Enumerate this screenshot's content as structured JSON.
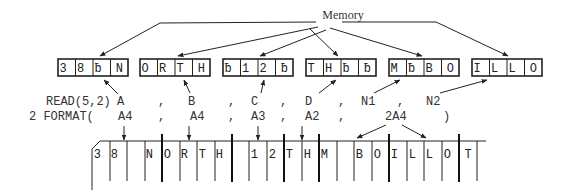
{
  "memory_label": "Memory",
  "memory_words": [
    {
      "var": "A",
      "chars": [
        "3",
        "8",
        "ƀ",
        "N"
      ]
    },
    {
      "var": "B",
      "chars": [
        "O",
        "R",
        "T",
        "H"
      ]
    },
    {
      "var": "C",
      "chars": [
        "ƀ",
        "1",
        "2",
        "ƀ"
      ]
    },
    {
      "var": "D",
      "chars": [
        "T",
        "H",
        "ƀ",
        "ƀ"
      ]
    },
    {
      "var": "N1",
      "chars": [
        "M",
        "ƀ",
        "B",
        "O"
      ]
    },
    {
      "var": "N2",
      "chars": [
        "I",
        "L",
        "L",
        "O"
      ]
    }
  ],
  "read_statement": {
    "prefix": "READ(5,2)",
    "items": [
      "A",
      "B",
      "C",
      "D",
      "N1",
      "N2"
    ],
    "separator": ","
  },
  "format_statement": {
    "prefix": "2 FORMAT(",
    "items": [
      "A4",
      "A4",
      "A3",
      "A2",
      "2A4"
    ],
    "separator": ",",
    "suffix": ")"
  },
  "card_columns": [
    "3",
    "8",
    "",
    "N",
    "O",
    "R",
    "T",
    "H",
    "",
    "1",
    "2",
    "T",
    "H",
    "M",
    "",
    "B",
    "O",
    "I",
    "L",
    "L",
    "O",
    "T",
    ""
  ],
  "colors": {
    "ink": "#222222",
    "background": "#ffffff"
  }
}
